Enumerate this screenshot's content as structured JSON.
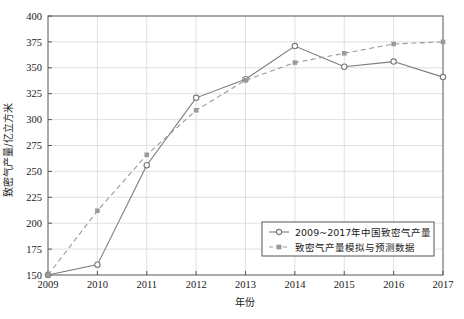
{
  "chart_data": {
    "type": "line",
    "title": "",
    "xlabel": "年份",
    "ylabel": "致密气产量/亿立方米",
    "x": [
      2009,
      2010,
      2011,
      2012,
      2013,
      2014,
      2015,
      2016,
      2017
    ],
    "xtick_labels": [
      "2009",
      "2010",
      "2011",
      "2012",
      "2013",
      "2014",
      "2015",
      "2016",
      "2017"
    ],
    "ytick_labels": [
      "150",
      "175",
      "200",
      "225",
      "250",
      "275",
      "300",
      "325",
      "350",
      "375",
      "400"
    ],
    "yticks": [
      150,
      175,
      200,
      225,
      250,
      275,
      300,
      325,
      350,
      375,
      400
    ],
    "xlim": [
      2009,
      2017
    ],
    "ylim": [
      150,
      400
    ],
    "grid": true,
    "legend_position": "lower right",
    "series": [
      {
        "name": "2009~2017年中国致密气产量",
        "values": [
          150,
          160,
          256,
          321,
          339,
          371,
          351,
          356,
          341
        ],
        "line_style": "solid",
        "marker": "circle-open",
        "color": "#7a7a7a"
      },
      {
        "name": "致密气产量模拟与预测数据",
        "values": [
          150,
          212,
          266,
          309,
          338,
          355,
          364,
          373,
          375
        ],
        "line_style": "dashed",
        "marker": "square-filled",
        "color": "#9a9a9a"
      }
    ]
  },
  "legend": {
    "entries": [
      {
        "label": "2009~2017年中国致密气产量"
      },
      {
        "label": "致密气产量模拟与预测数据"
      }
    ]
  },
  "colors": {
    "series_solid": "#7a7a7a",
    "series_dashed": "#9a9a9a",
    "grid": "#d8d8d8",
    "axis": "#555555",
    "background": "#ffffff"
  }
}
